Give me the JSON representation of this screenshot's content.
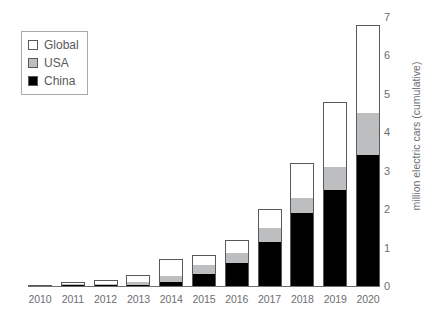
{
  "chart_data": {
    "type": "bar",
    "stacked": true,
    "title": "",
    "subtitle": "",
    "xlabel": "",
    "ylabel": "million electric cars (cumulative)",
    "categories": [
      "2010",
      "2011",
      "2012",
      "2013",
      "2014",
      "2015",
      "2016",
      "2017",
      "2018",
      "2019",
      "2020"
    ],
    "ylim": [
      0,
      7
    ],
    "yticks": [
      0,
      1,
      2,
      3,
      4,
      5,
      6,
      7
    ],
    "ytick_labels": [
      "0",
      "1",
      "2",
      "3",
      "4",
      "5",
      "6",
      "7"
    ],
    "y_axis_position": "right",
    "grid": false,
    "legend_position": "top-left",
    "series": [
      {
        "name": "China",
        "color": "#000000",
        "values": [
          0.0,
          0.01,
          0.02,
          0.03,
          0.1,
          0.3,
          0.6,
          1.15,
          1.9,
          2.5,
          3.4
        ]
      },
      {
        "name": "USA",
        "color": "#bcbec0",
        "values": [
          0.0,
          0.01,
          0.03,
          0.07,
          0.17,
          0.25,
          0.25,
          0.35,
          0.4,
          0.6,
          1.1
        ]
      },
      {
        "name": "Global",
        "color": "#ffffff",
        "values": [
          0.02,
          0.04,
          0.1,
          0.2,
          0.43,
          0.25,
          0.35,
          0.5,
          0.9,
          1.7,
          2.3
        ]
      }
    ],
    "totals": [
      0.02,
      0.06,
      0.15,
      0.3,
      0.7,
      0.8,
      1.2,
      2.0,
      3.2,
      4.8,
      6.8
    ],
    "legend": [
      {
        "label": "Global",
        "swatch": "white-square",
        "color": "#ffffff"
      },
      {
        "label": "USA",
        "swatch": "gray-square",
        "color": "#bcbec0"
      },
      {
        "label": "China",
        "swatch": "black-square",
        "color": "#000000"
      }
    ]
  }
}
